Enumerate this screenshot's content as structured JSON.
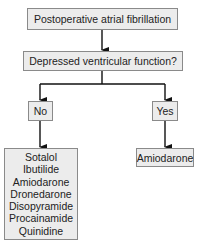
{
  "diagram": {
    "root": "Postoperative atrial fibrillation",
    "question": "Depressed ventricular function?",
    "branches": {
      "no": {
        "label": "No",
        "drugs": [
          "Sotalol",
          "Ibutilide",
          "Amiodarone",
          "Dronedarone",
          "Disopyramide",
          "Procainamide",
          "Quinidine"
        ]
      },
      "yes": {
        "label": "Yes",
        "drugs": [
          "Amiodarone"
        ]
      }
    }
  }
}
